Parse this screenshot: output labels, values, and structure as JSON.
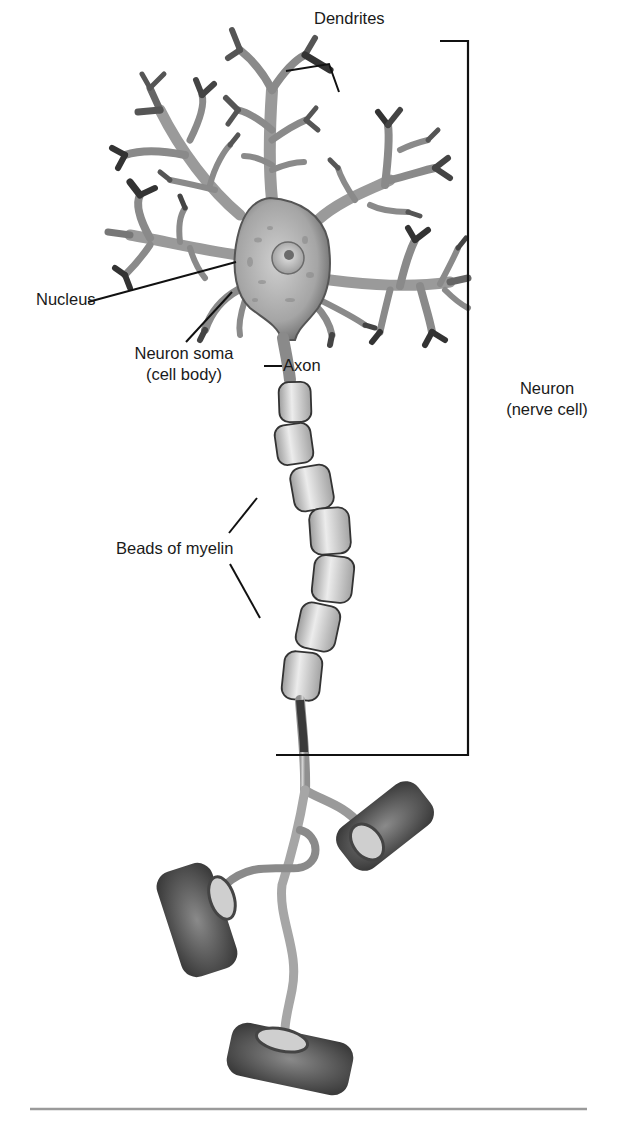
{
  "figure": {
    "labels": {
      "dendrites": "Dendrites",
      "nucleus": "Nucleus",
      "soma_line1": "Neuron soma",
      "soma_line2": "(cell body)",
      "axon": "Axon",
      "neuron_line1": "Neuron",
      "neuron_line2": "(nerve cell)",
      "myelin": "Beads of myelin"
    },
    "parts": [
      "dendrites",
      "nucleus",
      "neuron soma",
      "axon",
      "myelin beads",
      "axon terminals"
    ],
    "myelin_bead_count": 7,
    "axon_terminal_count": 3,
    "colors": {
      "background": "#ffffff",
      "lines": "#111111",
      "cell_light": "#d9d9d9",
      "cell_mid": "#9a9a9a",
      "cell_dark": "#4a4a4a",
      "divider": "#9a9a9a"
    }
  }
}
